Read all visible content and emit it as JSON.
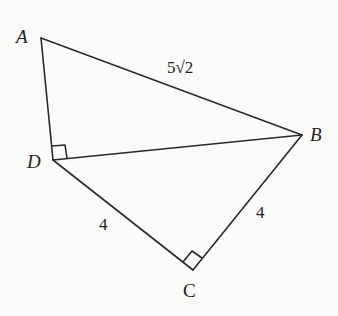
{
  "figure": {
    "type": "geometry-diagram",
    "vertices": [
      {
        "name": "A",
        "label": "A",
        "x": 41,
        "y": 38,
        "lx": 16,
        "ly": 43
      },
      {
        "name": "B",
        "label": "B",
        "x": 302,
        "y": 135,
        "lx": 310,
        "ly": 141
      },
      {
        "name": "C",
        "label": "C",
        "x": 193,
        "y": 270,
        "lx": 183,
        "ly": 297
      },
      {
        "name": "D",
        "label": "D",
        "x": 53,
        "y": 160,
        "lx": 27,
        "ly": 168
      }
    ],
    "segments": [
      {
        "from": "A",
        "to": "B",
        "label": "5√2"
      },
      {
        "from": "A",
        "to": "D",
        "label": ""
      },
      {
        "from": "D",
        "to": "B",
        "label": ""
      },
      {
        "from": "D",
        "to": "C",
        "label": "4"
      },
      {
        "from": "C",
        "to": "B",
        "label": "4"
      }
    ],
    "side_labels": {
      "AB": {
        "text": "5√2",
        "x": 167,
        "y": 73
      },
      "DC": {
        "text": "4",
        "x": 99,
        "y": 230
      },
      "CB": {
        "text": "4",
        "x": 256,
        "y": 218
      }
    },
    "right_angles": [
      "ADB",
      "DCB"
    ],
    "stroke_color": "#2a2a2a",
    "label_color": "#222222"
  }
}
